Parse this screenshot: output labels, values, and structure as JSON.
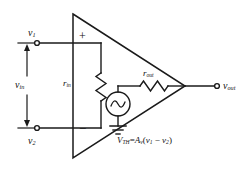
{
  "diagram": {
    "stroke_color": "#1a1a1a",
    "background_color": "#ffffff",
    "terminals": {
      "v1_label": "v",
      "v1_sub": "1",
      "v2_label": "v",
      "v2_sub": "2",
      "vin_label": "v",
      "vin_sub": "in",
      "vout_label": "v",
      "vout_sub": "out"
    },
    "amplifier": {
      "plus_sign": "+",
      "minus_sign": "−"
    },
    "components": {
      "r_in_label": "r",
      "r_in_sub": "in",
      "r_out_label": "r",
      "r_out_sub": "out",
      "source_symbol": "ac-source",
      "ground_symbol": "ground"
    },
    "equation": {
      "lhs_var": "V",
      "lhs_sub": "TH",
      "equals": "=",
      "gain_var": "A",
      "gain_sub": "v",
      "open_paren": "(",
      "term1": "v",
      "term1_sub": "1",
      "minus": "−",
      "term2": "v",
      "term2_sub": "2",
      "close_paren": ")"
    }
  }
}
